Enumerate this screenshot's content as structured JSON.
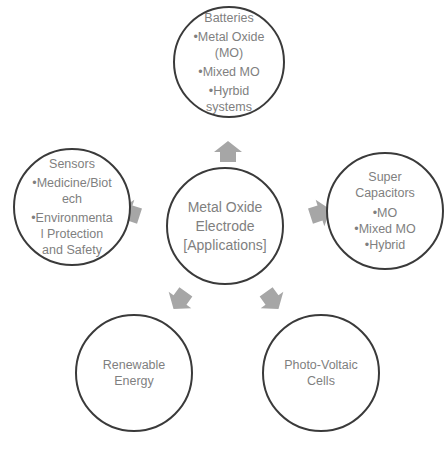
{
  "diagram": {
    "center": {
      "lines": [
        "Metal Oxide",
        "Electrode",
        "[Applications]"
      ]
    },
    "nodes": [
      {
        "id": "batteries",
        "title": "Batteries",
        "items": [
          "•Metal Oxide",
          "(MO)",
          "•Mixed MO",
          "•Hyrbid",
          "systems"
        ]
      },
      {
        "id": "super-capacitors",
        "title": "Super",
        "title2": "Capacitors",
        "items": [
          "•MO",
          "•Mixed MO",
          "•Hybrid"
        ]
      },
      {
        "id": "sensors",
        "title": "Sensors",
        "items": [
          "•Medicine/Biot",
          "ech",
          "•Environmenta",
          "l Protection",
          "and Safety"
        ]
      },
      {
        "id": "renewable-energy",
        "title": "Renewable",
        "title2": "Energy"
      },
      {
        "id": "photo-voltaic",
        "title": "Photo-Voltaic",
        "title2": "Cells"
      }
    ],
    "colors": {
      "arrow": "#a6a6a6",
      "outline": "#3a3a3a",
      "text": "#7f7f7f"
    }
  }
}
